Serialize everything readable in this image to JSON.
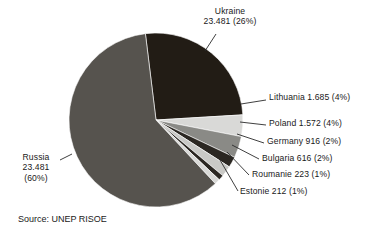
{
  "chart_data": {
    "type": "pie",
    "title": "",
    "subtitle": "",
    "source": "Source: UNEP RISOE",
    "legend_position": "callout-labels",
    "grid": false,
    "categories": [
      "Ukraine",
      "Lithuania",
      "Poland",
      "Germany",
      "Bulgaria",
      "Roumanie",
      "Estonie",
      "Russia"
    ],
    "values": [
      23.481,
      1.685,
      1.572,
      916,
      616,
      223,
      212,
      23.481
    ],
    "percentages": [
      26,
      4,
      4,
      2,
      2,
      1,
      1,
      60
    ],
    "slices": [
      {
        "name": "Ukraine",
        "value_text": "23.481",
        "percent_text": "(26%)",
        "percent": 26,
        "label": "Ukraine\n23.481 (26%)",
        "color": "#221c15",
        "start_angle": -7,
        "sweep": 93.6
      },
      {
        "name": "Lithuania",
        "value_text": "1.685",
        "percent_text": "(4%)",
        "percent": 4,
        "label": "Lithuania 1.685 (4%)",
        "color": "#d9d9d7",
        "start_angle": 86.6,
        "sweep": 14.4
      },
      {
        "name": "Poland",
        "value_text": "1.572",
        "percent_text": "(4%)",
        "percent": 4,
        "label": "Poland 1.572 (4%)",
        "color": "#8a8a86",
        "start_angle": 101.0,
        "sweep": 14.4
      },
      {
        "name": "Germany",
        "value_text": "916",
        "percent_text": "(2%)",
        "percent": 2,
        "label": "Germany 916 (2%)",
        "color": "#2b2722",
        "start_angle": 115.4,
        "sweep": 7.2
      },
      {
        "name": "Bulgaria",
        "value_text": "616",
        "percent_text": "(2%)",
        "percent": 2,
        "label": "Bulgaria 616 (2%)",
        "color": "#c9c9c6",
        "start_angle": 122.6,
        "sweep": 7.2
      },
      {
        "name": "Roumanie",
        "value_text": "223",
        "percent_text": "(1%)",
        "percent": 1,
        "label": "Roumanie 223 (1%)",
        "color": "#2b2722",
        "start_angle": 129.8,
        "sweep": 3.6
      },
      {
        "name": "Estonie",
        "value_text": "212",
        "percent_text": "(1%)",
        "percent": 1,
        "label": "Estonie 212 (1%)",
        "color": "#d9d9d7",
        "start_angle": 133.4,
        "sweep": 3.6
      },
      {
        "name": "Russia",
        "value_text": "23.481",
        "percent_text": "(60%)",
        "percent": 60,
        "label": "Russia\n23.481\n(60%)",
        "color": "#56534e",
        "start_angle": 137.0,
        "sweep": 216
      }
    ],
    "xlabel": "",
    "ylabel": ""
  },
  "labels": {
    "ukraine_line1": "Ukraine",
    "ukraine_line2": "23.481 (26%)",
    "lithuania": "Lithuania 1.685 (4%)",
    "poland": "Poland 1.572 (4%)",
    "germany": "Germany 916 (2%)",
    "bulgaria": "Bulgaria 616 (2%)",
    "roumanie": "Roumanie 223 (1%)",
    "estonie": "Estonie 212 (1%)",
    "russia_line1": "Russia",
    "russia_line2": "23.481",
    "russia_line3": "(60%)"
  },
  "source": {
    "text": "Source: UNEP RISOE"
  },
  "colors": {
    "background": "#ffffff",
    "text": "#1a1a1a",
    "leader_line": "#2a2a2a",
    "ukraine": "#221c15",
    "lithuania": "#d9d9d7",
    "poland": "#8a8a86",
    "germany": "#2b2722",
    "bulgaria": "#c9c9c6",
    "roumanie": "#2b2722",
    "estonie": "#d9d9d7",
    "russia": "#56534e"
  }
}
